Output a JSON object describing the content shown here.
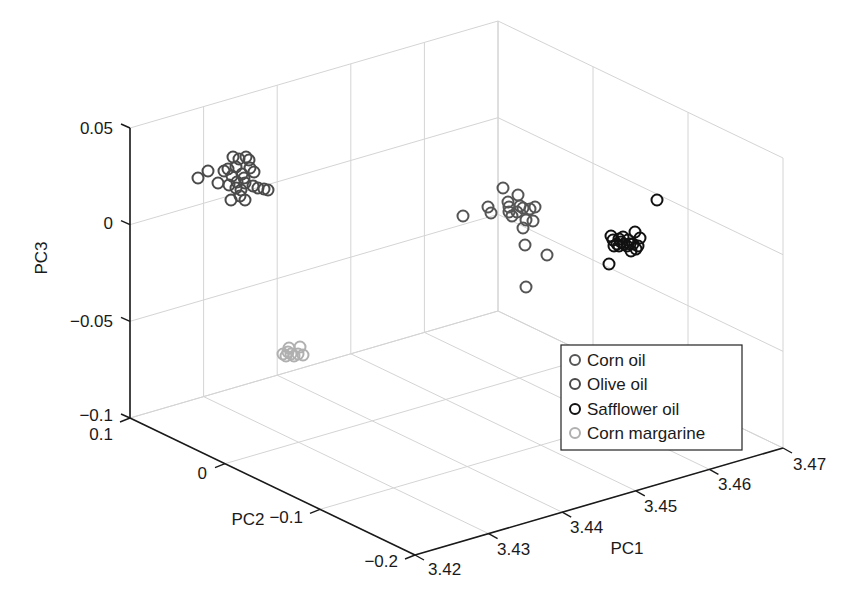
{
  "chart_data": {
    "type": "scatter",
    "title": "",
    "xlabel": "PC1",
    "ylabel": "PC2",
    "zlabel": "PC3",
    "xlim": [
      3.42,
      3.47
    ],
    "ylim": [
      -0.2,
      0.1
    ],
    "zlim": [
      -0.1,
      0.05
    ],
    "x_ticks": [
      "3.42",
      "3.43",
      "3.44",
      "3.45",
      "3.46",
      "3.47"
    ],
    "y_ticks": [
      "0.1",
      "0",
      "−0.1",
      "−0.2"
    ],
    "z_ticks": [
      "0.05",
      "0",
      "−0.05",
      "−0.1"
    ],
    "grid": true,
    "legend_position": "lower right (inside)",
    "series": [
      {
        "name": "Corn oil",
        "color": "#555555",
        "screen_points": [
          [
            463,
            216
          ],
          [
            488,
            207
          ],
          [
            491,
            213
          ],
          [
            503,
            188
          ],
          [
            508,
            202
          ],
          [
            509,
            212
          ],
          [
            512,
            216
          ],
          [
            518,
            195
          ],
          [
            520,
            206
          ],
          [
            523,
            208
          ],
          [
            526,
            220
          ],
          [
            523,
            228
          ],
          [
            525,
            245
          ],
          [
            530,
            209
          ],
          [
            535,
            207
          ],
          [
            533,
            221
          ],
          [
            547,
            255
          ],
          [
            526,
            287
          ],
          [
            509,
            207
          ],
          [
            517,
            212
          ]
        ]
      },
      {
        "name": "Olive oil",
        "color": "#4a4a4a",
        "screen_points": [
          [
            198,
            178
          ],
          [
            208,
            171
          ],
          [
            218,
            183
          ],
          [
            224,
            171
          ],
          [
            228,
            169
          ],
          [
            233,
            157
          ],
          [
            236,
            167
          ],
          [
            239,
            159
          ],
          [
            242,
            174
          ],
          [
            244,
            178
          ],
          [
            246,
            157
          ],
          [
            249,
            160
          ],
          [
            236,
            188
          ],
          [
            241,
            190
          ],
          [
            245,
            200
          ],
          [
            231,
            200
          ],
          [
            240,
            196
          ],
          [
            254,
            172
          ],
          [
            253,
            186
          ],
          [
            258,
            188
          ],
          [
            264,
            189
          ],
          [
            268,
            190
          ],
          [
            250,
            168
          ],
          [
            232,
            176
          ],
          [
            237,
            182
          ],
          [
            229,
            185
          ],
          [
            245,
            183
          ]
        ]
      },
      {
        "name": "Safflower oil",
        "color": "#111111",
        "screen_points": [
          [
            657,
            200
          ],
          [
            611,
            236
          ],
          [
            613,
            240
          ],
          [
            617,
            244
          ],
          [
            619,
            246
          ],
          [
            621,
            242
          ],
          [
            624,
            244
          ],
          [
            627,
            246
          ],
          [
            630,
            244
          ],
          [
            633,
            244
          ],
          [
            635,
            232
          ],
          [
            638,
            246
          ],
          [
            640,
            238
          ],
          [
            619,
            239
          ],
          [
            623,
            237
          ],
          [
            628,
            240
          ],
          [
            609,
            264
          ],
          [
            614,
            246
          ],
          [
            636,
            249
          ],
          [
            631,
            251
          ]
        ]
      },
      {
        "name": "Corn margarine",
        "color": "#b0b0b0",
        "screen_points": [
          [
            283,
            354
          ],
          [
            286,
            356
          ],
          [
            289,
            348
          ],
          [
            291,
            354
          ],
          [
            294,
            356
          ],
          [
            298,
            354
          ],
          [
            300,
            347
          ],
          [
            303,
            355
          ],
          [
            288,
            352
          ]
        ]
      }
    ]
  },
  "axes": {
    "pc3_label": "PC3",
    "pc2_label": "PC2",
    "pc1_label": "PC1"
  },
  "legend": {
    "items": [
      {
        "label": "Corn oil",
        "color": "#555555"
      },
      {
        "label": "Olive oil",
        "color": "#4a4a4a"
      },
      {
        "label": "Safflower oil",
        "color": "#111111"
      },
      {
        "label": "Corn margarine",
        "color": "#b0b0b0"
      }
    ]
  }
}
